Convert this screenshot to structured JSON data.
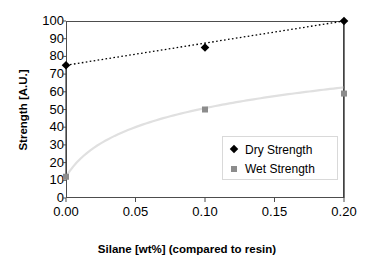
{
  "chart_data": {
    "type": "scatter",
    "title": "",
    "xlabel": "Silane [wt%] (compared to resin)",
    "ylabel": "Strength [A.U.]",
    "xlim": [
      0.0,
      0.2
    ],
    "ylim": [
      0,
      100
    ],
    "grid": false,
    "legend_position": "inside-lower-right",
    "x": [
      0.0,
      0.1,
      0.2
    ],
    "xticks": [
      "0.00",
      "0.05",
      "0.10",
      "0.15",
      "0.20"
    ],
    "xtick_values": [
      0.0,
      0.05,
      0.1,
      0.15,
      0.2
    ],
    "yticks": [
      "0",
      "10",
      "20",
      "30",
      "40",
      "50",
      "60",
      "70",
      "80",
      "90",
      "100"
    ],
    "ytick_values": [
      0,
      10,
      20,
      30,
      40,
      50,
      60,
      70,
      80,
      90,
      100
    ],
    "series": [
      {
        "name": "Dry Strength",
        "values": [
          75,
          85,
          100
        ],
        "marker": "diamond",
        "color": "#000000",
        "trendline": "dotted-linear"
      },
      {
        "name": "Wet Strength",
        "values": [
          12,
          50,
          59
        ],
        "marker": "square",
        "color": "#8c8c8c",
        "trendline": "smooth-curve-light-gray"
      }
    ]
  },
  "axes": {
    "y_title": "Strength [A.U.]",
    "x_title": "Silane [wt%] (compared to resin)"
  },
  "legend": {
    "entries": [
      {
        "label": "Dry Strength",
        "marker": "diamond-marker-icon"
      },
      {
        "label": "Wet Strength",
        "marker": "square-marker-icon"
      }
    ]
  },
  "colors": {
    "dry_series": "#000000",
    "wet_series": "#8c8c8c",
    "wet_curve": "#e0e0e0",
    "frame": "#4d4d4d",
    "legend_border": "#d9d9d9",
    "background": "#ffffff"
  }
}
